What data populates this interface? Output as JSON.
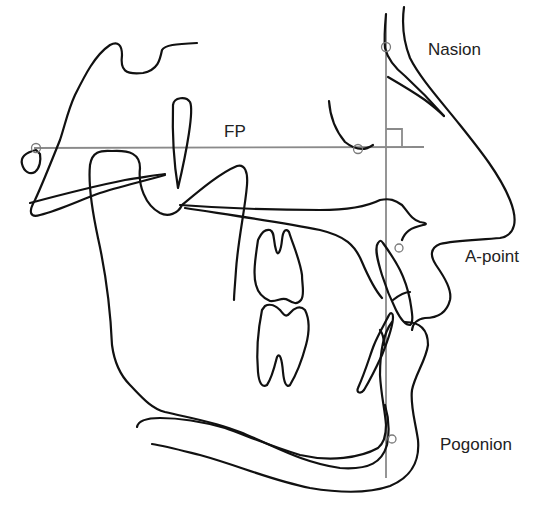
{
  "diagram": {
    "colors": {
      "trace": "#111111",
      "reference_line": "#8a8a8a",
      "landmark": "#7a7a7a",
      "label": "#222222",
      "background": "#ffffff"
    },
    "reference_lines": {
      "frankfort_plane": {
        "label": "FP"
      },
      "perpendicular": {
        "right_angle_marker": true
      }
    },
    "landmarks": [
      {
        "id": "porion",
        "label": ""
      },
      {
        "id": "orbitale",
        "label": ""
      },
      {
        "id": "nasion",
        "label": "Nasion"
      },
      {
        "id": "a_point",
        "label": "A-point"
      },
      {
        "id": "pogonion",
        "label": "Pogonion"
      }
    ],
    "labels": {
      "fp": "FP",
      "nasion": "Nasion",
      "a_point": "A-point",
      "pogonion": "Pogonion"
    }
  }
}
